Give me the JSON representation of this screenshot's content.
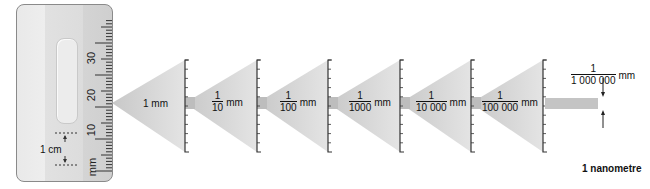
{
  "ruler": {
    "unit_label": "mm",
    "tick_labels": [
      "10",
      "20",
      "30"
    ],
    "scale_marker_label": "1 cm"
  },
  "magnification_steps": [
    {
      "type": "whole",
      "text": "1 mm"
    },
    {
      "type": "fraction",
      "numerator": "1",
      "denominator": "10",
      "unit": "mm"
    },
    {
      "type": "fraction",
      "numerator": "1",
      "denominator": "100",
      "unit": "mm"
    },
    {
      "type": "fraction",
      "numerator": "1",
      "denominator": "1000",
      "unit": "mm"
    },
    {
      "type": "fraction",
      "numerator": "1",
      "denominator": "10 000",
      "unit": "mm"
    },
    {
      "type": "fraction",
      "numerator": "1",
      "denominator": "100 000",
      "unit": "mm"
    }
  ],
  "final": {
    "numerator": "1",
    "denominator": "1 000 000",
    "unit": "mm",
    "caption": "1 nanometre"
  },
  "colors": {
    "cone": "#d6d6d6",
    "cone_dark": "#bdbdbd",
    "band": "#c4c4c4",
    "bracket": "#333333",
    "ruler_border": "#8a8a8a"
  }
}
